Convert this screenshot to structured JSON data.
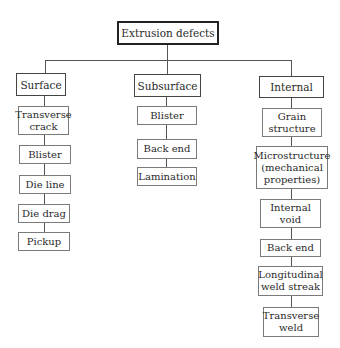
{
  "diagram": {
    "root": {
      "label": "Extrusion defects"
    },
    "categories": [
      {
        "label": "Surface",
        "children": [
          "Transverse\ncrack",
          "Blister",
          "Die line",
          "Die drag",
          "Pickup"
        ]
      },
      {
        "label": "Subsurface",
        "children": [
          "Blister",
          "Back end",
          "Lamination"
        ]
      },
      {
        "label": "Internal",
        "children": [
          "Grain\nstructure",
          "Microstructure\n(mechanical\nproperties)",
          "Internal\nvoid",
          "Back end",
          "Longitudinal\nweld streak",
          "Transverse\nweld"
        ]
      }
    ]
  }
}
